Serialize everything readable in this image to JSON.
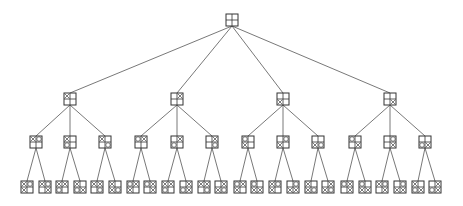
{
  "diagram": {
    "type": "tree",
    "node_size": 12,
    "colors": {
      "edge": "#555555",
      "box_stroke": "#333333",
      "mark": "#444444",
      "background": "#ffffff"
    },
    "levels": [
      {
        "depth": 0,
        "y": 20,
        "nodes": [
          {
            "id": "r",
            "x": 232,
            "cells": [
              "",
              "",
              "",
              ""
            ]
          }
        ]
      },
      {
        "depth": 1,
        "y": 99,
        "nodes": [
          {
            "id": "a",
            "x": 70,
            "parent": "r",
            "cells": [
              "x",
              "",
              "",
              ""
            ]
          },
          {
            "id": "b",
            "x": 177,
            "parent": "r",
            "cells": [
              "",
              "x",
              "",
              ""
            ]
          },
          {
            "id": "c",
            "x": 283,
            "parent": "r",
            "cells": [
              "",
              "",
              "x",
              ""
            ]
          },
          {
            "id": "d",
            "x": 390,
            "parent": "r",
            "cells": [
              "",
              "",
              "",
              "x"
            ]
          }
        ]
      },
      {
        "depth": 2,
        "y": 142,
        "nodes": [
          {
            "id": "a1",
            "x": 36,
            "parent": "a",
            "cells": [
              "x",
              "o",
              "",
              ""
            ]
          },
          {
            "id": "a2",
            "x": 70,
            "parent": "a",
            "cells": [
              "x",
              "",
              "o",
              ""
            ]
          },
          {
            "id": "a3",
            "x": 105,
            "parent": "a",
            "cells": [
              "x",
              "",
              "",
              "o"
            ]
          },
          {
            "id": "b1",
            "x": 141,
            "parent": "b",
            "cells": [
              "o",
              "x",
              "",
              ""
            ]
          },
          {
            "id": "b2",
            "x": 177,
            "parent": "b",
            "cells": [
              "",
              "x",
              "o",
              ""
            ]
          },
          {
            "id": "b3",
            "x": 212,
            "parent": "b",
            "cells": [
              "",
              "x",
              "",
              "o"
            ]
          },
          {
            "id": "c1",
            "x": 248,
            "parent": "c",
            "cells": [
              "o",
              "",
              "x",
              ""
            ]
          },
          {
            "id": "c2",
            "x": 283,
            "parent": "c",
            "cells": [
              "",
              "o",
              "x",
              ""
            ]
          },
          {
            "id": "c3",
            "x": 318,
            "parent": "c",
            "cells": [
              "",
              "",
              "x",
              "o"
            ]
          },
          {
            "id": "d1",
            "x": 355,
            "parent": "d",
            "cells": [
              "o",
              "",
              "",
              "x"
            ]
          },
          {
            "id": "d2",
            "x": 390,
            "parent": "d",
            "cells": [
              "",
              "o",
              "",
              "x"
            ]
          },
          {
            "id": "d3",
            "x": 425,
            "parent": "d",
            "cells": [
              "",
              "",
              "o",
              "x"
            ]
          }
        ]
      },
      {
        "depth": 3,
        "y": 187,
        "nodes": [
          {
            "id": "a1a",
            "x": 27,
            "parent": "a1",
            "cells": [
              "x",
              "o",
              "x",
              ""
            ]
          },
          {
            "id": "a1b",
            "x": 45,
            "parent": "a1",
            "cells": [
              "x",
              "o",
              "",
              "x"
            ]
          },
          {
            "id": "a2a",
            "x": 62,
            "parent": "a2",
            "cells": [
              "x",
              "x",
              "o",
              ""
            ]
          },
          {
            "id": "a2b",
            "x": 80,
            "parent": "a2",
            "cells": [
              "x",
              "",
              "o",
              "x"
            ]
          },
          {
            "id": "a3a",
            "x": 97,
            "parent": "a3",
            "cells": [
              "x",
              "x",
              "",
              "o"
            ]
          },
          {
            "id": "a3b",
            "x": 115,
            "parent": "a3",
            "cells": [
              "x",
              "",
              "x",
              "o"
            ]
          },
          {
            "id": "b1a",
            "x": 133,
            "parent": "b1",
            "cells": [
              "o",
              "x",
              "x",
              ""
            ]
          },
          {
            "id": "b1b",
            "x": 150,
            "parent": "b1",
            "cells": [
              "o",
              "x",
              "",
              "x"
            ]
          },
          {
            "id": "b2a",
            "x": 168,
            "parent": "b2",
            "cells": [
              "x",
              "x",
              "o",
              ""
            ]
          },
          {
            "id": "b2b",
            "x": 186,
            "parent": "b2",
            "cells": [
              "",
              "x",
              "o",
              "x"
            ]
          },
          {
            "id": "b3a",
            "x": 204,
            "parent": "b3",
            "cells": [
              "x",
              "x",
              "",
              "o"
            ]
          },
          {
            "id": "b3b",
            "x": 221,
            "parent": "b3",
            "cells": [
              "",
              "x",
              "x",
              "o"
            ]
          },
          {
            "id": "c1a",
            "x": 240,
            "parent": "c1",
            "cells": [
              "o",
              "x",
              "x",
              ""
            ]
          },
          {
            "id": "c1b",
            "x": 257,
            "parent": "c1",
            "cells": [
              "o",
              "",
              "x",
              "x"
            ]
          },
          {
            "id": "c2a",
            "x": 275,
            "parent": "c2",
            "cells": [
              "x",
              "o",
              "x",
              ""
            ]
          },
          {
            "id": "c2b",
            "x": 293,
            "parent": "c2",
            "cells": [
              "",
              "o",
              "x",
              "x"
            ]
          },
          {
            "id": "c3a",
            "x": 311,
            "parent": "c3",
            "cells": [
              "x",
              "",
              "x",
              "o"
            ]
          },
          {
            "id": "c3b",
            "x": 328,
            "parent": "c3",
            "cells": [
              "",
              "x",
              "x",
              "o"
            ]
          },
          {
            "id": "d1a",
            "x": 347,
            "parent": "d1",
            "cells": [
              "o",
              "x",
              "",
              "x"
            ]
          },
          {
            "id": "d1b",
            "x": 365,
            "parent": "d1",
            "cells": [
              "o",
              "",
              "x",
              "x"
            ]
          },
          {
            "id": "d2a",
            "x": 382,
            "parent": "d2",
            "cells": [
              "x",
              "o",
              "",
              "x"
            ]
          },
          {
            "id": "d2b",
            "x": 400,
            "parent": "d2",
            "cells": [
              "",
              "o",
              "x",
              "x"
            ]
          },
          {
            "id": "d3a",
            "x": 418,
            "parent": "d3",
            "cells": [
              "x",
              "",
              "o",
              "x"
            ]
          },
          {
            "id": "d3b",
            "x": 435,
            "parent": "d3",
            "cells": [
              "",
              "x",
              "o",
              "x"
            ]
          }
        ]
      }
    ]
  }
}
